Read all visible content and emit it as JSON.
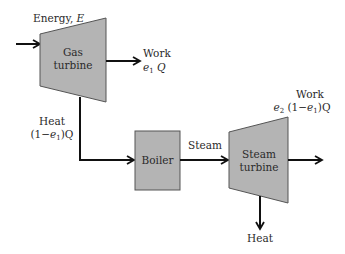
{
  "colors": {
    "block_fill": "#b4b4b4",
    "block_stroke": "#555555",
    "line": "#111111",
    "text": "#2a2a2a"
  },
  "blocks": {
    "gas_turbine": {
      "line1": "Gas",
      "line2": "turbine"
    },
    "boiler": {
      "label": "Boiler"
    },
    "steam_turbine": {
      "line1": "Steam",
      "line2": "turbine"
    }
  },
  "labels": {
    "energy_in": {
      "text": "Energy, ",
      "var": "E"
    },
    "work1": {
      "title": "Work",
      "expr_var": "e",
      "expr_sub": "1",
      "expr_tail": " Q"
    },
    "heat1": {
      "title": "Heat",
      "expr_pre": "(1−",
      "expr_var": "e",
      "expr_sub": "1",
      "expr_tail": ")Q"
    },
    "steam": {
      "text": "Steam"
    },
    "work2": {
      "title": "Work",
      "v1": "e",
      "s1": "2",
      "mid": " (1−",
      "v2": "e",
      "s2": "1",
      "tail": ")Q"
    },
    "heat2": {
      "text": "Heat"
    }
  }
}
